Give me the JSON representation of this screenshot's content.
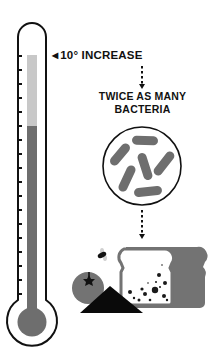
{
  "figure": {
    "annotation": {
      "arrow_glyph": "◀",
      "text": "10° INCREASE"
    },
    "result": {
      "line1": "TWICE AS MANY",
      "line2": "BACTERIA"
    },
    "colors": {
      "outline": "#111111",
      "mercury_dark": "#6e6e6e",
      "mercury_light": "#c8c8c8",
      "bacteria": "#6e6e6e",
      "food_gray": "#737373",
      "background": "#ffffff"
    },
    "thermometer": {
      "tick_count": 18,
      "increase_segment": "light gray top section of mercury column",
      "base_segment": "dark gray lower section of mercury column"
    },
    "illustration_items": [
      "thermometer",
      "bacteria-circle",
      "fly",
      "tomato",
      "bread-slice",
      "black-triangle"
    ]
  }
}
